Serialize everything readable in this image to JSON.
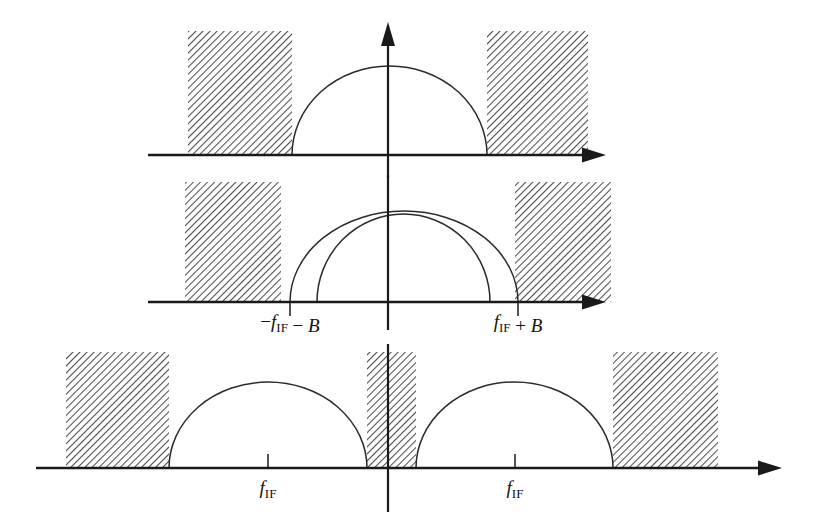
{
  "figure": {
    "background_color": "#ffffff",
    "line_color": "#1a1a1a",
    "curve_color": "#2b2b2b",
    "hatch_color": "#555555"
  },
  "panels": [
    {
      "id": "panel-top",
      "name": "top-panel",
      "axis": {
        "y": 155,
        "x_start": 148,
        "x_end": 604,
        "arrow": "right"
      },
      "vertical_axis": {
        "x": 388,
        "y_top": 26,
        "y_bottom": 178,
        "arrow": "up"
      },
      "bands": [
        {
          "name": "left-interference-band",
          "x": 188,
          "width": 104,
          "y": 31,
          "height": 124
        },
        {
          "name": "right-interference-band",
          "x": 487,
          "width": 101,
          "y": 31,
          "height": 124
        }
      ],
      "curves": [
        {
          "name": "signal-lobe",
          "left": 292,
          "right": 487,
          "peak_y": 66
        }
      ],
      "ticks": [],
      "labels": []
    },
    {
      "id": "panel-middle",
      "name": "middle-panel",
      "axis": {
        "y": 302,
        "x_start": 148,
        "x_end": 604,
        "arrow": "right"
      },
      "vertical_axis": {
        "x": 388,
        "y_top": 175,
        "y_bottom": 330,
        "arrow": "none"
      },
      "bands": [
        {
          "name": "left-interference-band",
          "x": 185,
          "width": 96,
          "y": 182,
          "height": 120
        },
        {
          "name": "right-interference-band",
          "x": 515,
          "width": 96,
          "y": 182,
          "height": 120
        }
      ],
      "curves": [
        {
          "name": "outer-signal-lobe",
          "left": 290,
          "right": 518,
          "peak_y": 211
        },
        {
          "name": "inner-signal-lobe",
          "left": 317,
          "right": 490,
          "peak_y": 214
        }
      ],
      "ticks": [
        {
          "name": "tick-neg-fif-minus-b",
          "x": 290,
          "y_top": 302,
          "y_bottom": 316
        },
        {
          "name": "tick-pos-fif-plus-b",
          "x": 518,
          "y_top": 302,
          "y_bottom": 316
        }
      ],
      "labels": [
        {
          "name": "label-neg-fif-minus-b",
          "x": 290,
          "y": 328,
          "anchor": "middle",
          "parts": [
            {
              "text": "−",
              "style": "op"
            },
            {
              "text": "f",
              "style": "mi"
            },
            {
              "text": "IF",
              "style": "sub"
            },
            {
              "text": " − ",
              "style": "op"
            },
            {
              "text": "B",
              "style": "mi"
            }
          ],
          "plain": "−f_IF − B"
        },
        {
          "name": "label-pos-fif-plus-b",
          "x": 518,
          "y": 328,
          "anchor": "middle",
          "parts": [
            {
              "text": "f",
              "style": "mi"
            },
            {
              "text": "IF",
              "style": "sub"
            },
            {
              "text": " + ",
              "style": "op"
            },
            {
              "text": "B",
              "style": "mi"
            }
          ],
          "plain": "f_IF + B"
        }
      ]
    },
    {
      "id": "panel-bottom",
      "name": "bottom-panel",
      "axis": {
        "y": 468,
        "x_start": 36,
        "x_end": 780,
        "arrow": "right"
      },
      "vertical_axis": {
        "x": 388,
        "y_top": 344,
        "y_bottom": 512,
        "arrow": "none"
      },
      "bands": [
        {
          "name": "far-left-interference-band",
          "x": 66,
          "width": 103,
          "y": 352,
          "height": 116
        },
        {
          "name": "center-interference-band",
          "x": 367,
          "width": 49,
          "y": 352,
          "height": 116
        },
        {
          "name": "far-right-interference-band",
          "x": 613,
          "width": 105,
          "y": 352,
          "height": 116
        }
      ],
      "curves": [
        {
          "name": "negative-frequency-signal-lobe",
          "left": 169,
          "right": 367,
          "peak_y": 382
        },
        {
          "name": "positive-frequency-signal-lobe",
          "left": 416,
          "right": 613,
          "peak_y": 382
        }
      ],
      "ticks": [
        {
          "name": "tick-neg-fif",
          "x": 268,
          "y_top": 454,
          "y_bottom": 468
        },
        {
          "name": "tick-pos-fif",
          "x": 515,
          "y_top": 454,
          "y_bottom": 468
        }
      ],
      "labels": [
        {
          "name": "label-neg-fif",
          "x": 268,
          "y": 494,
          "anchor": "middle",
          "parts": [
            {
              "text": "f",
              "style": "mi"
            },
            {
              "text": "IF",
              "style": "sub"
            }
          ],
          "plain": "f_IF"
        },
        {
          "name": "label-pos-fif",
          "x": 515,
          "y": 494,
          "anchor": "middle",
          "parts": [
            {
              "text": "f",
              "style": "mi"
            },
            {
              "text": "IF",
              "style": "sub"
            }
          ],
          "plain": "f_IF"
        }
      ]
    }
  ],
  "chart_data": {
    "type": "line",
    "xlabel": "",
    "ylabel": "",
    "grid": false,
    "legend": "none",
    "panels": [
      {
        "name": "top-panel",
        "series": [
          {
            "name": "baseband-signal-lobe",
            "shape": "semicircle",
            "center": 0,
            "halfwidth": 1.0,
            "amplitude": 1.0
          }
        ],
        "hatched_bands": [
          {
            "name": "left-interference",
            "from": -2.04,
            "to": -1.0
          },
          {
            "name": "right-interference",
            "from": 1.0,
            "to": 2.02
          }
        ],
        "tick_labels": []
      },
      {
        "name": "middle-panel",
        "series": [
          {
            "name": "outer-lobe",
            "shape": "semicircle",
            "center": 0,
            "halfwidth": 1.14,
            "amplitude": 1.0
          },
          {
            "name": "inner-lobe",
            "shape": "semicircle",
            "center": 0,
            "halfwidth": 0.865,
            "amplitude": 0.97
          }
        ],
        "hatched_bands": [
          {
            "name": "left-interference",
            "from": -2.06,
            "to": -1.1
          },
          {
            "name": "right-interference",
            "from": 1.14,
            "to": 2.1
          }
        ],
        "tick_labels": [
          "−f_IF − B",
          "f_IF + B"
        ],
        "tick_positions": [
          -1.14,
          1.14
        ]
      },
      {
        "name": "bottom-panel",
        "series": [
          {
            "name": "negative-image-lobe",
            "shape": "semicircle",
            "center": -1.2,
            "halfwidth": 0.99,
            "amplitude": 0.86
          },
          {
            "name": "positive-signal-lobe",
            "shape": "semicircle",
            "center": 1.2,
            "halfwidth": 0.985,
            "amplitude": 0.86
          }
        ],
        "hatched_bands": [
          {
            "name": "far-left-interference",
            "from": -3.22,
            "to": -2.19
          },
          {
            "name": "center-interference",
            "from": -0.21,
            "to": 0.28
          },
          {
            "name": "far-right-interference",
            "from": 2.25,
            "to": 3.3
          }
        ],
        "tick_labels": [
          "f_IF",
          "f_IF"
        ],
        "tick_positions": [
          -1.2,
          1.27
        ]
      }
    ]
  }
}
